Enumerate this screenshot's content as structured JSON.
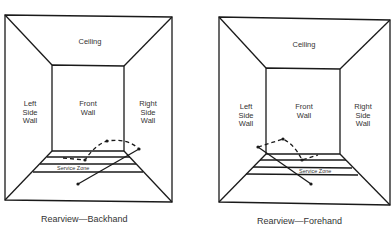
{
  "diagrams": [
    {
      "caption": "Rearview—Backhand",
      "labels": {
        "ceiling": "Ceiling",
        "front_wall": "Front\nWall",
        "left_wall": "Left\nSide\nWall",
        "right_wall": "Right\nSide\nWall",
        "service_zone": "Service Zone"
      }
    },
    {
      "caption": "Rearview—Forehand",
      "labels": {
        "ceiling": "Ceiling",
        "front_wall": "Front\nWall",
        "left_wall": "Left\nSide\nWall",
        "right_wall": "Right\nSide\nWall",
        "service_zone": "Service Zone"
      }
    }
  ],
  "colors": {
    "line": "#1a1a1a",
    "text": "#333333",
    "background": "#ffffff"
  }
}
